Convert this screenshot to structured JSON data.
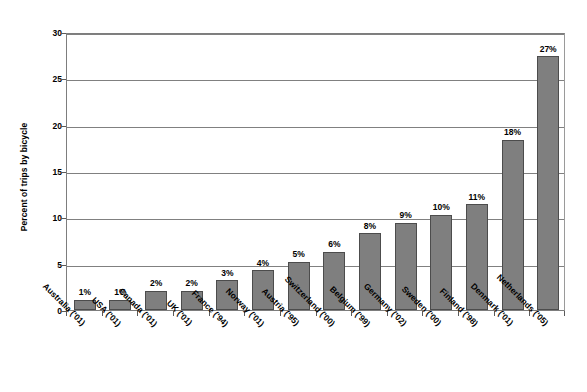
{
  "chart_data": {
    "type": "bar",
    "title": "",
    "subtitle": "",
    "xlabel": "",
    "ylabel": "Percent of trips by bicycle",
    "ylim": [
      0,
      30
    ],
    "yticks": [
      0,
      5,
      10,
      15,
      20,
      25,
      30
    ],
    "ytick_labels": [
      "0",
      "5",
      "10",
      "15",
      "20",
      "25",
      "30"
    ],
    "grid": true,
    "legend": false,
    "legend_position": "none",
    "orientation": "vertical",
    "bar_color": "#7f7f7f",
    "bar_edge_color": "#4c4c4c",
    "gridline_color": "#808080",
    "categories": [
      "Australia ('01)",
      "USA ('01)",
      "Canada ('01)",
      "UK ('01)",
      "France ('94)",
      "Norway ('01)",
      "Austria ('95)",
      "Switzerland  ('00)",
      "Belgium ('99)",
      "Germany ('02)",
      "Sweden ('00)",
      "Finland ('98)",
      "Denmark ('01)",
      "Netherlands ('05)"
    ],
    "values": [
      1.1,
      1.1,
      2.1,
      2.1,
      3.2,
      4.3,
      5.2,
      6.3,
      8.3,
      9.4,
      10.3,
      11.4,
      18.4,
      27.4
    ],
    "data_labels": [
      "1%",
      "1%",
      "2%",
      "2%",
      "3%",
      "4%",
      "5%",
      "6%",
      "8%",
      "9%",
      "10%",
      "11%",
      "18%",
      "27%"
    ]
  }
}
